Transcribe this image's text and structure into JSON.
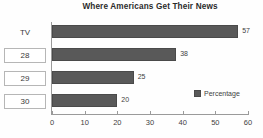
{
  "chart_data": {
    "type": "bar",
    "orientation": "horizontal",
    "title": "Where Americans Get Their News",
    "xlabel": "",
    "ylabel": "",
    "categories": [
      "TV",
      "28",
      "29",
      "30"
    ],
    "values": [
      57,
      38,
      25,
      20
    ],
    "data_labels": [
      "57",
      "38",
      "25",
      "20"
    ],
    "series": [
      {
        "name": "Percentage",
        "values": [
          57,
          38,
          25,
          20
        ],
        "color": "#595959"
      }
    ],
    "xlim": [
      0,
      60
    ],
    "xticks": [
      0,
      10,
      20,
      30,
      40,
      50,
      60
    ],
    "xtick_labels": [
      "0",
      "10",
      "20",
      "30",
      "40",
      "50",
      "60"
    ],
    "grid": false,
    "legend": {
      "position": "bottom-right",
      "entries": [
        {
          "label": "Percentage",
          "color": "#595959"
        }
      ]
    },
    "category_styles": [
      {
        "label": "TV",
        "boxed": false
      },
      {
        "label": "28",
        "boxed": true
      },
      {
        "label": "29",
        "boxed": true
      },
      {
        "label": "30",
        "boxed": true
      }
    ]
  }
}
